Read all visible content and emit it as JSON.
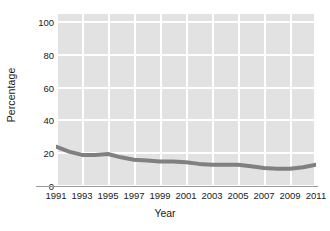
{
  "chart_data": {
    "type": "line",
    "title": "",
    "xlabel": "Year",
    "ylabel": "Percentage",
    "xlim": [
      1991,
      2011
    ],
    "ylim": [
      0,
      105
    ],
    "grid": true,
    "legend": false,
    "y_ticks": [
      0,
      20,
      40,
      60,
      80,
      100
    ],
    "y_tick_labels": [
      "0",
      "20",
      "40",
      "60",
      "80",
      "100"
    ],
    "x_ticks": [
      1991,
      1993,
      1995,
      1997,
      1999,
      2001,
      2003,
      2005,
      2007,
      2009,
      2011
    ],
    "x_tick_labels": [
      "1991",
      "1993",
      "1995",
      "1997",
      "1999",
      "2001",
      "2003",
      "2005",
      "2007",
      "2009",
      "2011"
    ],
    "line_color": "#808080",
    "plot_background": "#e2e2e2",
    "grid_color": "#ffffff",
    "series": [
      {
        "name": "Percentage",
        "x": [
          1991,
          1992,
          1993,
          1994,
          1995,
          1996,
          1997,
          1998,
          1999,
          2000,
          2001,
          2002,
          2003,
          2004,
          2005,
          2006,
          2007,
          2008,
          2009,
          2010,
          2011
        ],
        "values": [
          24,
          21,
          19,
          19,
          19.5,
          17.5,
          16,
          15.5,
          15,
          15,
          14.5,
          13.5,
          13,
          13,
          13,
          12,
          11,
          10.5,
          10.5,
          11.5,
          13
        ]
      }
    ]
  },
  "axes": {
    "y_title": "Percentage",
    "x_title": "Year"
  }
}
